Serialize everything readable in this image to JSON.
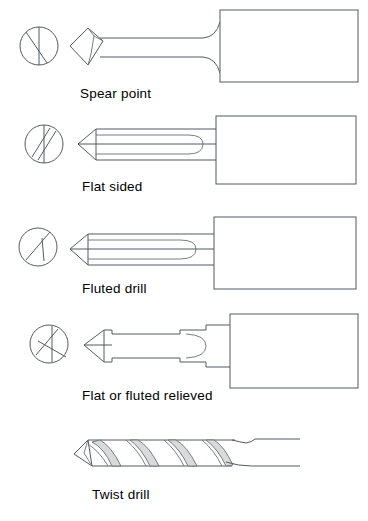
{
  "figure": {
    "background_color": "#ffffff",
    "line_color": "#555a5e",
    "text_color": "#000000"
  },
  "rows": [
    {
      "id": "spear-point",
      "caption": "Spear point",
      "end_view_icon": "circle-vertical-diagonal-icon",
      "end_view_description": "circle with vertical diameter and single diagonal chord",
      "profile_description": "diamond shaped spear point on a slender neck joining a rectangular shank"
    },
    {
      "id": "flat-sided",
      "caption": "Flat sided",
      "end_view_icon": "circle-two-parallel-diagonals-icon",
      "end_view_description": "circle with vertical diameter and two parallel diagonal chords",
      "profile_description": "conical point with flat sided body and rounded flute end joining a rectangular shank"
    },
    {
      "id": "fluted-drill",
      "caption": "Fluted drill",
      "end_view_icon": "circle-diagonal-with-branch-icon",
      "end_view_description": "circle with a diagonal chord and a short branch line",
      "profile_description": "conical point with fluted body and rounded flute end joining a rectangular shank"
    },
    {
      "id": "flat-or-fluted-relieved",
      "caption": "Flat or fluted relieved",
      "end_view_icon": "circle-crossed-diagonals-icon",
      "end_view_description": "circle with crossing diagonal chords and vertical line",
      "profile_description": "conical point with relieved stepped body and rounded flute end joining a rectangular shank"
    },
    {
      "id": "twist-drill",
      "caption": "Twist drill",
      "end_view_icon": null,
      "end_view_description": null,
      "profile_description": "conical point with helical flutes running along the body into a plain cylindrical shank"
    }
  ]
}
